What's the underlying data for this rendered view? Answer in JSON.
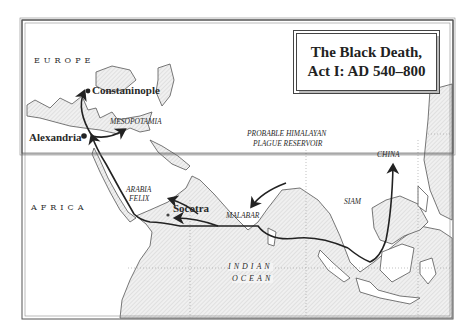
{
  "map": {
    "title_line1": "The Black Death,",
    "title_line2": "Act I: AD 540–800",
    "regions": {
      "europe": "EUROPE",
      "africa": "AFRICA",
      "mesopotamia": "MESOPOTAMIA",
      "arabia_felix_1": "ARABIA",
      "arabia_felix_2": "FELIX",
      "malabar": "MALABAR",
      "siam": "SIAM",
      "china": "CHINA",
      "indian_ocean_1": "INDIAN",
      "indian_ocean_2": "OCEAN"
    },
    "cities": {
      "constantinople": "Constaninople",
      "alexandria": "Alexandria",
      "socotra": "Socotra"
    },
    "annotation": {
      "line1": "PROBABLE HIMALAYAN",
      "line2": "PLAGUE RESERVOIR"
    },
    "colors": {
      "ink": "#222222",
      "land": "#ffffff",
      "sea": "#e4e4e4",
      "coast_halo": "#bcbcbc"
    }
  }
}
